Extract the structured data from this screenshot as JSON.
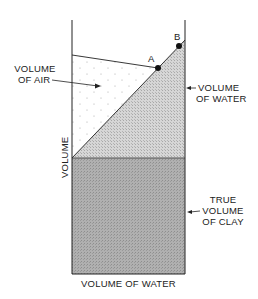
{
  "diagram": {
    "labels": {
      "air": [
        "VOLUME",
        "OF AIR"
      ],
      "water_right": [
        "VOLUME",
        "OF WATER"
      ],
      "clay": [
        "TRUE",
        "VOLUME",
        "OF CLAY"
      ],
      "y_axis": "VOLUME",
      "x_axis": "VOLUME OF WATER",
      "point_a": "A",
      "point_b": "B"
    },
    "colors": {
      "clay_fill": "#a9a9a9",
      "water_fill": "#cdcdcd",
      "air_fill": "#ffffff",
      "line": "#222222"
    }
  }
}
